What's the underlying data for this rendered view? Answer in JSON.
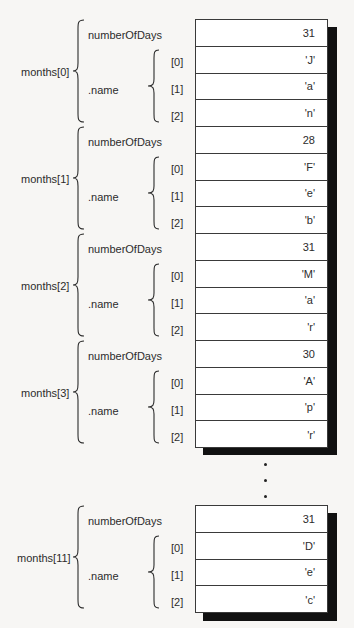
{
  "diagram": {
    "type": "memory-layout",
    "field_labels": {
      "days": "numberOfDays",
      "name": ".name",
      "idx0": "[0]",
      "idx1": "[1]",
      "idx2": "[2]"
    },
    "ellipsis": "...",
    "months": [
      {
        "label": "months[0]",
        "numberOfDays": "31",
        "name": [
          "'J'",
          "'a'",
          "'n'"
        ]
      },
      {
        "label": "months[1]",
        "numberOfDays": "28",
        "name": [
          "'F'",
          "'e'",
          "'b'"
        ]
      },
      {
        "label": "months[2]",
        "numberOfDays": "31",
        "name": [
          "'M'",
          "'a'",
          "'r'"
        ]
      },
      {
        "label": "months[3]",
        "numberOfDays": "30",
        "name": [
          "'A'",
          "'p'",
          "'r'"
        ]
      },
      {
        "label": "months[11]",
        "numberOfDays": "31",
        "name": [
          "'D'",
          "'e'",
          "'c'"
        ]
      }
    ]
  }
}
